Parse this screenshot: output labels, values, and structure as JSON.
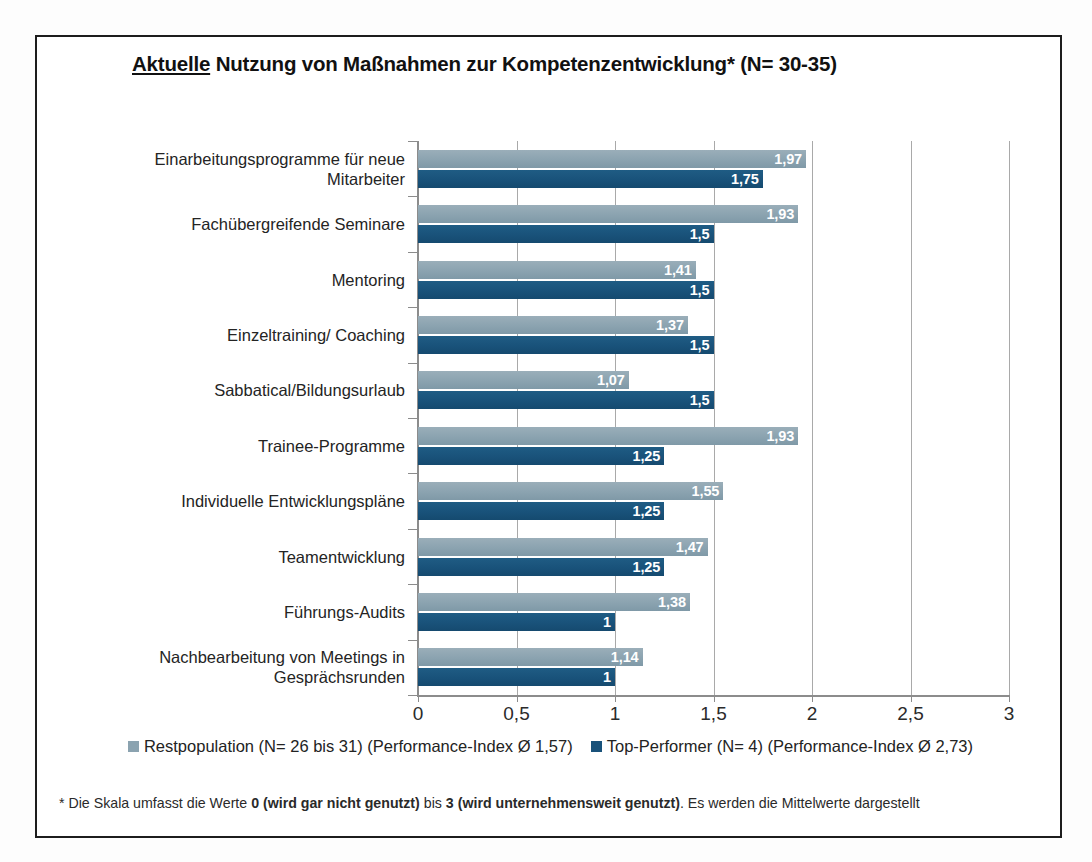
{
  "title": {
    "underlined": "Aktuelle",
    "rest": " Nutzung von Maßnahmen zur Kompetenzentwicklung* (N= 30-35)"
  },
  "legend": {
    "series1_label": "Restpopulation (N= 26 bis 31) (Performance-Index Ø 1,57)",
    "series2_label": "Top-Performer (N= 4) (Performance-Index Ø 2,73)",
    "series1_color": "#8ba3b0",
    "series2_color": "#19527a"
  },
  "footnote": {
    "pre": "* Die Skala umfasst die Werte ",
    "bold1": "0 (wird gar nicht genutzt)",
    "mid": " bis ",
    "bold2": "3 (wird unternehmensweit genutzt)",
    "post": ". Es werden die Mittelwerte dargestellt"
  },
  "chart_data": {
    "type": "bar",
    "orientation": "horizontal",
    "title": "Aktuelle Nutzung von Maßnahmen zur Kompetenzentwicklung* (N= 30-35)",
    "xlabel": "",
    "ylabel": "",
    "xlim": [
      0,
      3
    ],
    "xticks": [
      "0",
      "0,5",
      "1",
      "1,5",
      "2",
      "2,5",
      "3"
    ],
    "xtick_values": [
      0,
      0.5,
      1,
      1.5,
      2,
      2.5,
      3
    ],
    "grid": "vertical",
    "legend_position": "bottom",
    "categories": [
      "Einarbeitungsprogramme für neue Mitarbeiter",
      "Fachübergreifende Seminare",
      "Mentoring",
      "Einzeltraining/ Coaching",
      "Sabbatical/Bildungsurlaub",
      "Trainee-Programme",
      "Individuelle Entwicklungspläne",
      "Teamentwicklung",
      "Führungs-Audits",
      "Nachbearbeitung von Meetings in Gesprächsrunden"
    ],
    "category_lines": [
      [
        "Einarbeitungsprogramme für neue",
        "Mitarbeiter"
      ],
      [
        "Fachübergreifende Seminare"
      ],
      [
        "Mentoring"
      ],
      [
        "Einzeltraining/ Coaching"
      ],
      [
        "Sabbatical/Bildungsurlaub"
      ],
      [
        "Trainee-Programme"
      ],
      [
        "Individuelle Entwicklungspläne"
      ],
      [
        "Teamentwicklung"
      ],
      [
        "Führungs-Audits"
      ],
      [
        "Nachbearbeitung von Meetings in",
        "Gesprächsrunden"
      ]
    ],
    "series": [
      {
        "name": "Restpopulation (N= 26 bis 31) (Performance-Index Ø 1,57)",
        "short_name": "Restpopulation",
        "color": "#8ba3b0",
        "values": [
          1.97,
          1.93,
          1.41,
          1.37,
          1.07,
          1.93,
          1.55,
          1.47,
          1.38,
          1.14
        ],
        "labels": [
          "1,97",
          "1,93",
          "1,41",
          "1,37",
          "1,07",
          "1,93",
          "1,55",
          "1,47",
          "1,38",
          "1,14"
        ]
      },
      {
        "name": "Top-Performer (N= 4) (Performance-Index Ø 2,73)",
        "short_name": "Top-Performer",
        "color": "#19527a",
        "values": [
          1.75,
          1.5,
          1.5,
          1.5,
          1.5,
          1.25,
          1.25,
          1.25,
          1.0,
          1.0
        ],
        "labels": [
          "1,75",
          "1,5",
          "1,5",
          "1,5",
          "1,5",
          "1,25",
          "1,25",
          "1,25",
          "1",
          "1"
        ]
      }
    ]
  }
}
